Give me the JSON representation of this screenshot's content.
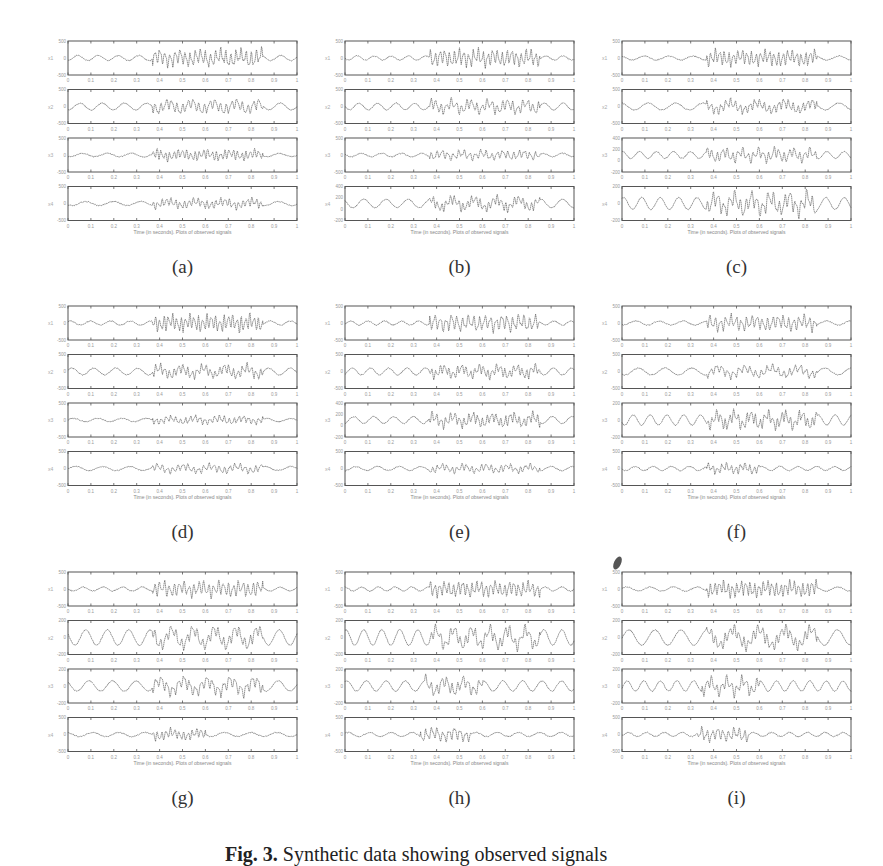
{
  "figure": {
    "x_axis_label": "Time (in seconds). Plots of observed signals",
    "x_ticks": [
      "0",
      "0.1",
      "0.2",
      "0.3",
      "0.4",
      "0.5",
      "0.6",
      "0.7",
      "0.8",
      "0.9",
      "1"
    ],
    "caption_prefix": "Fig. 3.",
    "caption_text": "Synthetic data showing observed signals"
  },
  "chart_data": [
    {
      "panel": "a",
      "type": "line",
      "title": "",
      "xlabel": "Time (in seconds). Plots of observed signals",
      "series": [
        {
          "name": "x1",
          "ylim": [
            -500,
            500
          ],
          "yticks": [
            "500",
            "0",
            "-500"
          ],
          "burst": [
            0.37,
            0.85
          ],
          "amp": 0.55,
          "base": 0.15,
          "seed": 1
        },
        {
          "name": "x2",
          "ylim": [
            -500,
            500
          ],
          "yticks": [
            "500",
            "0",
            "-500"
          ],
          "burst": [
            0.37,
            0.85
          ],
          "amp": 0.4,
          "base": 0.2,
          "seed": 2
        },
        {
          "name": "x3",
          "ylim": [
            -500,
            500
          ],
          "yticks": [
            "500",
            "0",
            "-500"
          ],
          "burst": [
            0.37,
            0.85
          ],
          "amp": 0.35,
          "base": 0.1,
          "seed": 3
        },
        {
          "name": "x4",
          "ylim": [
            -500,
            500
          ],
          "yticks": [
            "500",
            "0",
            "-500"
          ],
          "burst": [
            0.37,
            0.85
          ],
          "amp": 0.3,
          "base": 0.12,
          "seed": 4
        }
      ]
    },
    {
      "panel": "b",
      "type": "line",
      "title": "",
      "xlabel": "Time (in seconds). Plots of observed signals",
      "series": [
        {
          "name": "x1",
          "ylim": [
            -500,
            500
          ],
          "yticks": [
            "500",
            "0",
            "-500"
          ],
          "burst": [
            0.37,
            0.85
          ],
          "amp": 0.55,
          "base": 0.12,
          "seed": 5
        },
        {
          "name": "x2",
          "ylim": [
            -500,
            500
          ],
          "yticks": [
            "500",
            "0",
            "-500"
          ],
          "burst": [
            0.37,
            0.85
          ],
          "amp": 0.4,
          "base": 0.2,
          "seed": 6
        },
        {
          "name": "x3",
          "ylim": [
            -500,
            500
          ],
          "yticks": [
            "500",
            "0",
            "-500"
          ],
          "burst": [
            0.37,
            0.85
          ],
          "amp": 0.3,
          "base": 0.1,
          "seed": 7
        },
        {
          "name": "x4",
          "ylim": [
            -200,
            400
          ],
          "yticks": [
            "400",
            "200",
            "0",
            "-200"
          ],
          "burst": [
            0.37,
            0.85
          ],
          "amp": 0.35,
          "base": 0.25,
          "seed": 8
        }
      ]
    },
    {
      "panel": "c",
      "type": "line",
      "title": "",
      "xlabel": "Time (in seconds). Plots of observed signals",
      "series": [
        {
          "name": "x1",
          "ylim": [
            -500,
            500
          ],
          "yticks": [
            "500",
            "0",
            "-500"
          ],
          "burst": [
            0.37,
            0.85
          ],
          "amp": 0.5,
          "base": 0.12,
          "seed": 9
        },
        {
          "name": "x2",
          "ylim": [
            -500,
            500
          ],
          "yticks": [
            "500",
            "0",
            "-500"
          ],
          "burst": [
            0.37,
            0.85
          ],
          "amp": 0.35,
          "base": 0.2,
          "seed": 10
        },
        {
          "name": "x3",
          "ylim": [
            -200,
            400
          ],
          "yticks": [
            "400",
            "200",
            "0",
            "-200"
          ],
          "burst": [
            0.37,
            0.85
          ],
          "amp": 0.4,
          "base": 0.2,
          "seed": 11
        },
        {
          "name": "x4",
          "ylim": [
            -200,
            200
          ],
          "yticks": [
            "200",
            "0",
            "-200"
          ],
          "burst": [
            0.37,
            0.85
          ],
          "amp": 0.6,
          "base": 0.35,
          "seed": 12
        }
      ]
    },
    {
      "panel": "d",
      "type": "line",
      "title": "",
      "xlabel": "Time (in seconds). Plots of observed signals",
      "series": [
        {
          "name": "x1",
          "ylim": [
            -500,
            500
          ],
          "yticks": [
            "500",
            "0",
            "-500"
          ],
          "burst": [
            0.37,
            0.85
          ],
          "amp": 0.55,
          "base": 0.12,
          "seed": 13
        },
        {
          "name": "x2",
          "ylim": [
            -500,
            500
          ],
          "yticks": [
            "500",
            "0",
            "-500"
          ],
          "burst": [
            0.37,
            0.85
          ],
          "amp": 0.35,
          "base": 0.2,
          "seed": 14
        },
        {
          "name": "x3",
          "ylim": [
            -500,
            500
          ],
          "yticks": [
            "500",
            "0",
            "-500"
          ],
          "burst": [
            0.37,
            0.85
          ],
          "amp": 0.25,
          "base": 0.1,
          "seed": 15
        },
        {
          "name": "x4",
          "ylim": [
            -500,
            500
          ],
          "yticks": [
            "500",
            "0",
            "-500"
          ],
          "burst": [
            0.37,
            0.85
          ],
          "amp": 0.25,
          "base": 0.12,
          "seed": 16
        }
      ]
    },
    {
      "panel": "e",
      "type": "line",
      "title": "",
      "xlabel": "Time (in seconds). Plots of observed signals",
      "series": [
        {
          "name": "x1",
          "ylim": [
            -500,
            500
          ],
          "yticks": [
            "500",
            "0",
            "-500"
          ],
          "burst": [
            0.37,
            0.85
          ],
          "amp": 0.55,
          "base": 0.12,
          "seed": 17
        },
        {
          "name": "x2",
          "ylim": [
            -500,
            500
          ],
          "yticks": [
            "500",
            "0",
            "-500"
          ],
          "burst": [
            0.37,
            0.85
          ],
          "amp": 0.35,
          "base": 0.2,
          "seed": 18
        },
        {
          "name": "x3",
          "ylim": [
            -200,
            400
          ],
          "yticks": [
            "400",
            "200",
            "0",
            "-200"
          ],
          "burst": [
            0.37,
            0.85
          ],
          "amp": 0.4,
          "base": 0.2,
          "seed": 19
        },
        {
          "name": "x4",
          "ylim": [
            -500,
            500
          ],
          "yticks": [
            "500",
            "0",
            "-500"
          ],
          "burst": [
            0.37,
            0.85
          ],
          "amp": 0.25,
          "base": 0.12,
          "seed": 20
        }
      ]
    },
    {
      "panel": "f",
      "type": "line",
      "title": "",
      "xlabel": "Time (in seconds). Plots of observed signals",
      "series": [
        {
          "name": "x1",
          "ylim": [
            -500,
            500
          ],
          "yticks": [
            "500",
            "0",
            "-500"
          ],
          "burst": [
            0.37,
            0.85
          ],
          "amp": 0.5,
          "base": 0.12,
          "seed": 21
        },
        {
          "name": "x2",
          "ylim": [
            -500,
            500
          ],
          "yticks": [
            "500",
            "0",
            "-500"
          ],
          "burst": [
            0.37,
            0.85
          ],
          "amp": 0.3,
          "base": 0.2,
          "seed": 22
        },
        {
          "name": "x3",
          "ylim": [
            -200,
            200
          ],
          "yticks": [
            "200",
            "0",
            "-200"
          ],
          "burst": [
            0.37,
            0.85
          ],
          "amp": 0.45,
          "base": 0.3,
          "seed": 23
        },
        {
          "name": "x4",
          "ylim": [
            -500,
            500
          ],
          "yticks": [
            "500",
            "0",
            "-500"
          ],
          "burst": [
            0.37,
            0.6
          ],
          "amp": 0.3,
          "base": 0.12,
          "seed": 24
        }
      ]
    },
    {
      "panel": "g",
      "type": "line",
      "title": "",
      "xlabel": "Time (in seconds). Plots of observed signals",
      "series": [
        {
          "name": "x1",
          "ylim": [
            -500,
            500
          ],
          "yticks": [
            "500",
            "0",
            "-500"
          ],
          "burst": [
            0.37,
            0.85
          ],
          "amp": 0.5,
          "base": 0.12,
          "seed": 25
        },
        {
          "name": "x2",
          "ylim": [
            -200,
            200
          ],
          "yticks": [
            "200",
            "0",
            "-200"
          ],
          "burst": [
            0.37,
            0.85
          ],
          "amp": 0.45,
          "base": 0.45,
          "seed": 26
        },
        {
          "name": "x3",
          "ylim": [
            -200,
            200
          ],
          "yticks": [
            "200",
            "0",
            "-200"
          ],
          "burst": [
            0.37,
            0.85
          ],
          "amp": 0.45,
          "base": 0.3,
          "seed": 27
        },
        {
          "name": "x4",
          "ylim": [
            -500,
            500
          ],
          "yticks": [
            "500",
            "0",
            "-500"
          ],
          "burst": [
            0.37,
            0.6
          ],
          "amp": 0.35,
          "base": 0.12,
          "seed": 28
        }
      ]
    },
    {
      "panel": "h",
      "type": "line",
      "title": "",
      "xlabel": "Time (in seconds). Plots of observed signals",
      "series": [
        {
          "name": "x1",
          "ylim": [
            -500,
            500
          ],
          "yticks": [
            "500",
            "0",
            "-500"
          ],
          "burst": [
            0.37,
            0.85
          ],
          "amp": 0.5,
          "base": 0.12,
          "seed": 29
        },
        {
          "name": "x2",
          "ylim": [
            -200,
            200
          ],
          "yticks": [
            "200",
            "0",
            "-200"
          ],
          "burst": [
            0.37,
            0.85
          ],
          "amp": 0.45,
          "base": 0.45,
          "seed": 30
        },
        {
          "name": "x3",
          "ylim": [
            -200,
            200
          ],
          "yticks": [
            "200",
            "0",
            "-200"
          ],
          "burst": [
            0.35,
            0.6
          ],
          "amp": 0.45,
          "base": 0.3,
          "seed": 31
        },
        {
          "name": "x4",
          "ylim": [
            -500,
            500
          ],
          "yticks": [
            "500",
            "0",
            "-500"
          ],
          "burst": [
            0.33,
            0.55
          ],
          "amp": 0.45,
          "base": 0.12,
          "seed": 32
        }
      ]
    },
    {
      "panel": "i",
      "type": "line",
      "title": "",
      "xlabel": "Time (in seconds). Plots of observed signals",
      "series": [
        {
          "name": "x1",
          "ylim": [
            -500,
            500
          ],
          "yticks": [
            "500",
            "0",
            "-500"
          ],
          "burst": [
            0.37,
            0.85
          ],
          "amp": 0.5,
          "base": 0.12,
          "seed": 33
        },
        {
          "name": "x2",
          "ylim": [
            -200,
            200
          ],
          "yticks": [
            "200",
            "0",
            "-200"
          ],
          "burst": [
            0.37,
            0.85
          ],
          "amp": 0.45,
          "base": 0.45,
          "seed": 34
        },
        {
          "name": "x3",
          "ylim": [
            -200,
            200
          ],
          "yticks": [
            "200",
            "0",
            "-200"
          ],
          "burst": [
            0.35,
            0.6
          ],
          "amp": 0.45,
          "base": 0.3,
          "seed": 35
        },
        {
          "name": "x4",
          "ylim": [
            -500,
            500
          ],
          "yticks": [
            "500",
            "0",
            "-500"
          ],
          "burst": [
            0.33,
            0.55
          ],
          "amp": 0.45,
          "base": 0.12,
          "seed": 36
        }
      ]
    }
  ],
  "panels": [
    {
      "label": "(a)",
      "x": 40,
      "y": 38
    },
    {
      "label": "(b)",
      "x": 317,
      "y": 38
    },
    {
      "label": "(c)",
      "x": 594,
      "y": 38
    },
    {
      "label": "(d)",
      "x": 40,
      "y": 303
    },
    {
      "label": "(e)",
      "x": 317,
      "y": 303
    },
    {
      "label": "(f)",
      "x": 594,
      "y": 303
    },
    {
      "label": "(g)",
      "x": 40,
      "y": 569
    },
    {
      "label": "(h)",
      "x": 317,
      "y": 569
    },
    {
      "label": "(i)",
      "x": 594,
      "y": 569
    }
  ]
}
